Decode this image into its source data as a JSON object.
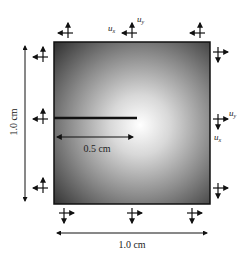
{
  "diagram": {
    "type": "crack-specimen-boundary-conditions",
    "specimen": {
      "shape": "square plate",
      "gradient": "radial, brightest near crack tip, dark at edges",
      "colors": {
        "edge": "#2e2e2e",
        "center": "#ffffff",
        "border": "#111111"
      }
    },
    "dimensions": {
      "height_label": "1.0 cm",
      "width_label": "1.0 cm",
      "crack_length_label": "0.5 cm"
    },
    "crack": {
      "length_fraction_of_width": 0.5,
      "position_fraction_of_height": 0.47,
      "edge": "left"
    },
    "displacement_labels": {
      "top": {
        "horizontal": "u",
        "horizontal_sub": "x",
        "vertical": "u",
        "vertical_sub": "y"
      },
      "right": {
        "horizontal": "u",
        "horizontal_sub": "y",
        "vertical": "u",
        "vertical_sub": "x"
      }
    },
    "boundary_arrows": {
      "top": {
        "count": 3,
        "directions": [
          "up",
          "left"
        ]
      },
      "left": {
        "count": 3,
        "directions": [
          "up",
          "left"
        ]
      },
      "right": {
        "count": 3,
        "directions": [
          "right",
          "down"
        ]
      },
      "bottom": {
        "count": 3,
        "directions": [
          "right",
          "down"
        ]
      }
    }
  }
}
